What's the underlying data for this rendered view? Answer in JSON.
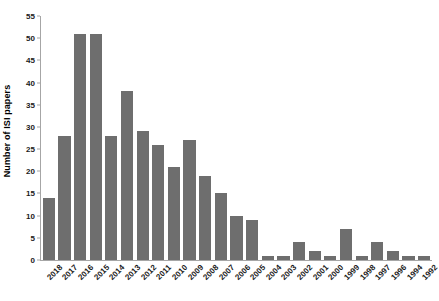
{
  "chart_data": {
    "type": "bar",
    "title": "",
    "subtitle": "",
    "xlabel": "",
    "ylabel": "Number of ISI papers",
    "ylim": [
      0,
      55
    ],
    "yticks": [
      0,
      5,
      10,
      15,
      20,
      25,
      30,
      35,
      40,
      45,
      50,
      55
    ],
    "grid": false,
    "legend": "none",
    "bar_color": "#6e6e6e",
    "axis_color": "#a6a6a6",
    "categories": [
      "2018",
      "2017",
      "2016",
      "2015",
      "2014",
      "2013",
      "2012",
      "2011",
      "2010",
      "2009",
      "2008",
      "2007",
      "2006",
      "2005",
      "2004",
      "2003",
      "2002",
      "2001",
      "2000",
      "1999",
      "1998",
      "1997",
      "1996",
      "1994",
      "1992"
    ],
    "values": [
      14,
      28,
      51,
      51,
      28,
      38,
      29,
      26,
      21,
      27,
      19,
      15,
      10,
      9,
      1,
      1,
      4,
      2,
      1,
      7,
      1,
      4,
      2,
      1,
      1
    ]
  }
}
